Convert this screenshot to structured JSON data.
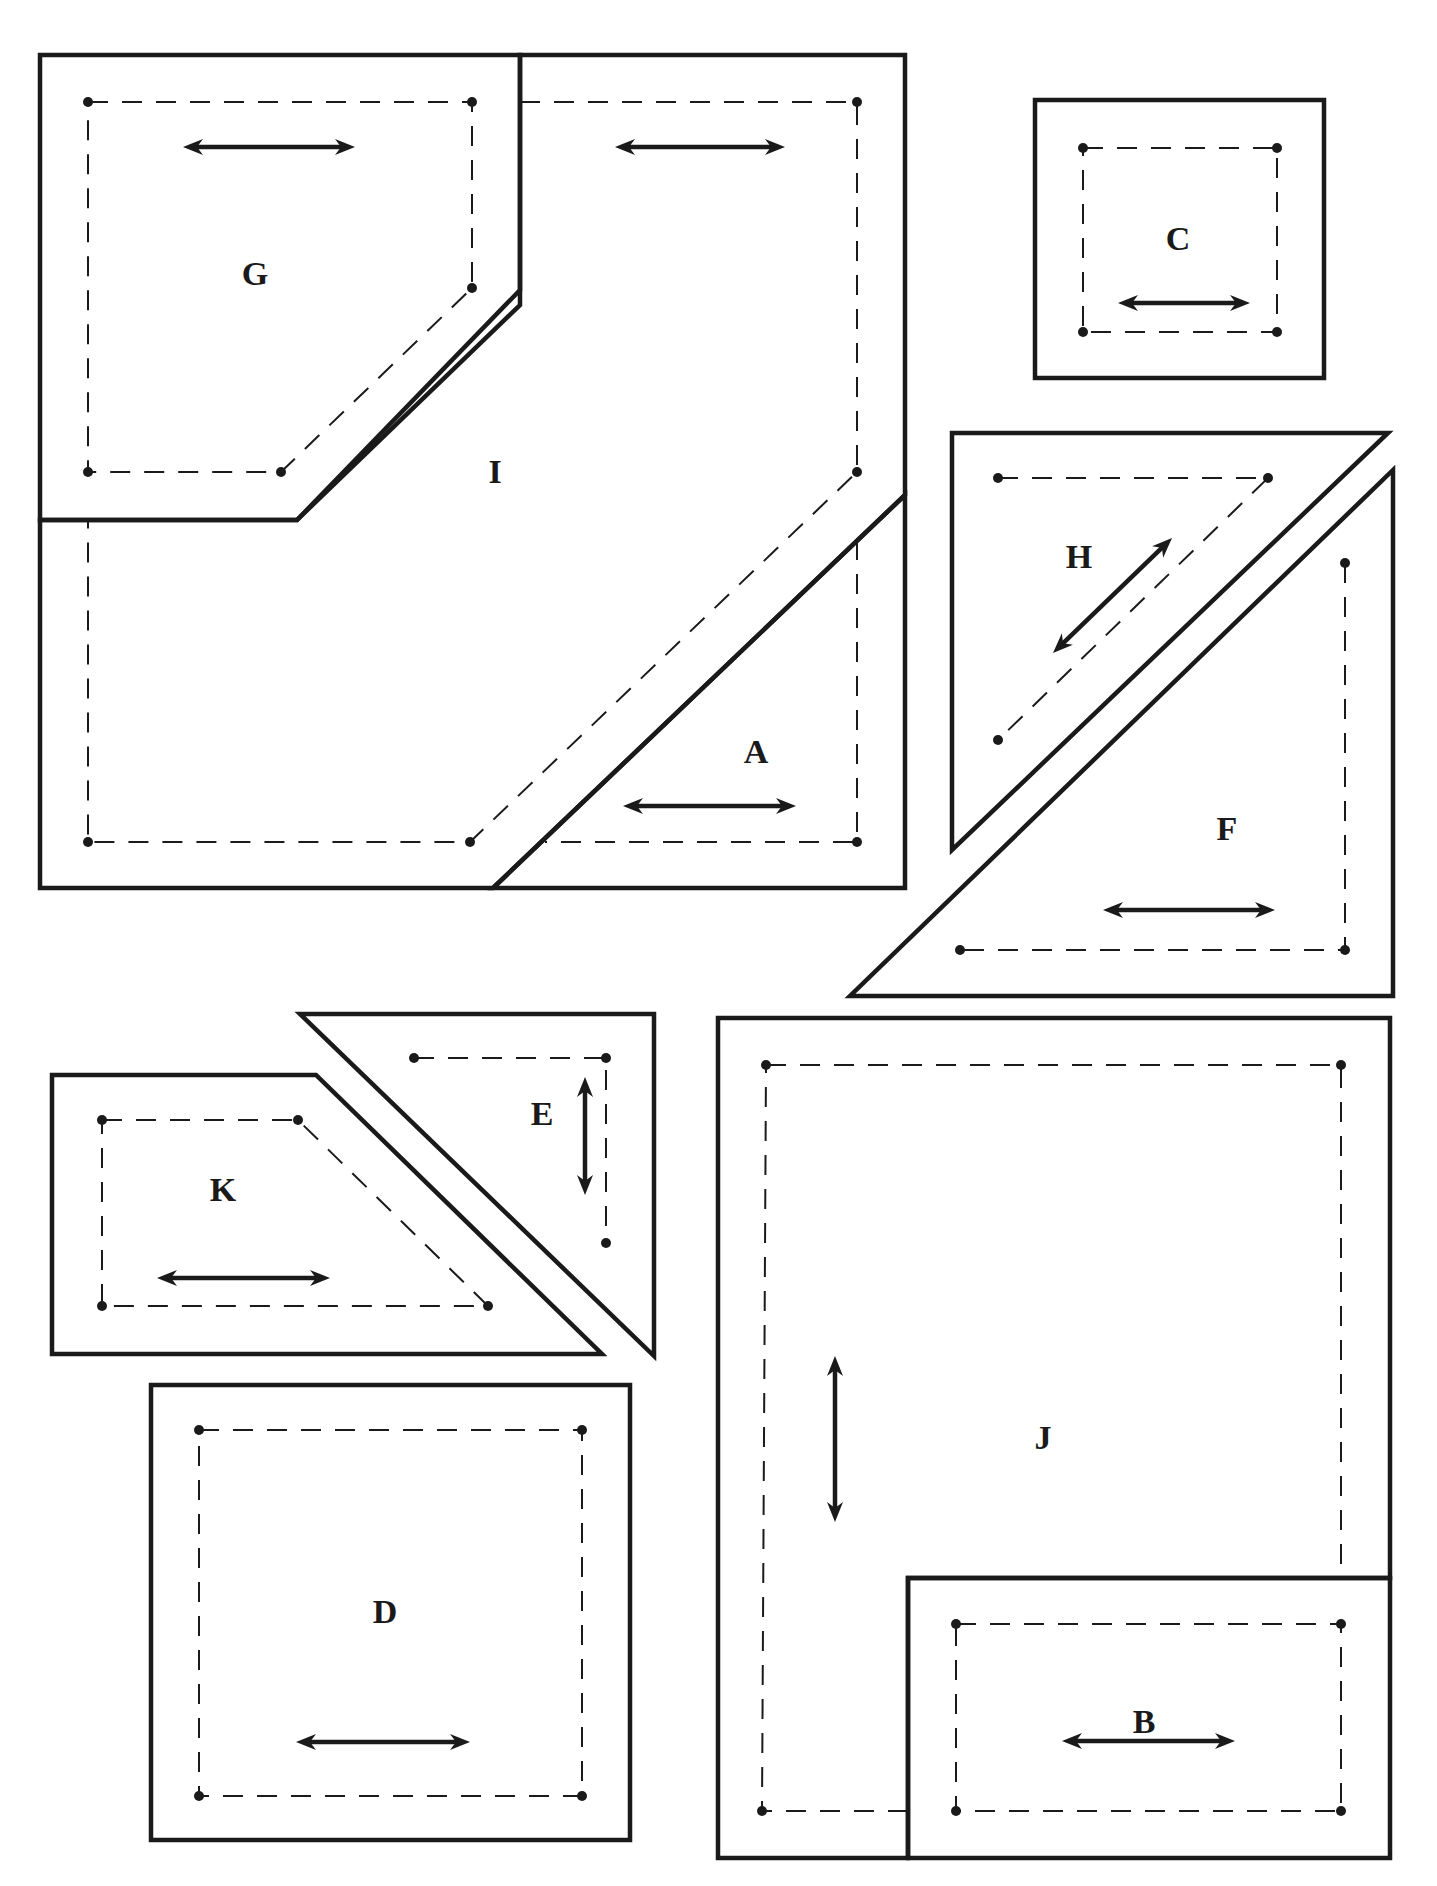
{
  "diagram": {
    "type": "quilt-pattern-templates",
    "colors": {
      "line": "#1a1a1a",
      "background": "#ffffff"
    },
    "pieces": [
      {
        "id": "I",
        "label": "I",
        "label_pos": [
          495,
          475
        ],
        "cut": [
          [
            40,
            55
          ],
          [
            520,
            55
          ],
          [
            520,
            290
          ],
          [
            297,
            520
          ],
          [
            40,
            520
          ],
          [
            40,
            888
          ],
          [
            493,
            888
          ],
          [
            905,
            495
          ],
          [
            905,
            55
          ],
          [
            520,
            55
          ]
        ],
        "cut_outline": [
          [
            520,
            55
          ],
          [
            905,
            55
          ],
          [
            905,
            495
          ],
          [
            493,
            888
          ],
          [
            40,
            888
          ],
          [
            40,
            520
          ],
          [
            297,
            520
          ],
          [
            520,
            290
          ]
        ],
        "sew": [
          [
            520,
            102
          ],
          [
            857,
            102
          ],
          [
            857,
            472
          ],
          [
            470,
            842
          ],
          [
            88,
            842
          ],
          [
            88,
            520
          ]
        ],
        "dots": [
          [
            857,
            102
          ],
          [
            857,
            472
          ],
          [
            470,
            842
          ],
          [
            88,
            842
          ]
        ],
        "grain": {
          "x1": 615,
          "y1": 147,
          "x2": 785,
          "y2": 147
        }
      },
      {
        "id": "G",
        "label": "G",
        "label_pos": [
          255,
          277
        ],
        "cut_outline": [
          [
            40,
            55
          ],
          [
            520,
            55
          ],
          [
            520,
            305
          ],
          [
            297,
            520
          ],
          [
            40,
            520
          ]
        ],
        "sew": [
          [
            88,
            102
          ],
          [
            472,
            102
          ],
          [
            472,
            288
          ],
          [
            281,
            472
          ],
          [
            88,
            472
          ]
        ],
        "dots": [
          [
            88,
            102
          ],
          [
            472,
            102
          ],
          [
            472,
            288
          ],
          [
            281,
            472
          ],
          [
            88,
            472
          ]
        ],
        "grain": {
          "x1": 183,
          "y1": 147,
          "x2": 355,
          "y2": 147
        }
      },
      {
        "id": "A",
        "label": "A",
        "label_pos": [
          756,
          755
        ],
        "cut_outline": [
          [
            905,
            495
          ],
          [
            905,
            888
          ],
          [
            493,
            888
          ]
        ],
        "sew": [
          [
            857,
            540
          ],
          [
            857,
            842
          ],
          [
            545,
            842
          ]
        ],
        "dots": [
          [
            857,
            842
          ]
        ],
        "grain": {
          "x1": 623,
          "y1": 806,
          "x2": 796,
          "y2": 806
        }
      },
      {
        "id": "C",
        "label": "C",
        "label_pos": [
          1178,
          242
        ],
        "cut_outline": [
          [
            1035,
            100
          ],
          [
            1324,
            100
          ],
          [
            1324,
            378
          ],
          [
            1035,
            378
          ]
        ],
        "sew": [
          [
            1083,
            148
          ],
          [
            1277,
            148
          ],
          [
            1277,
            332
          ],
          [
            1083,
            332
          ]
        ],
        "dots": [
          [
            1083,
            148
          ],
          [
            1277,
            148
          ],
          [
            1083,
            332
          ],
          [
            1277,
            332
          ]
        ],
        "grain": {
          "x1": 1118,
          "y1": 303,
          "x2": 1250,
          "y2": 303
        }
      },
      {
        "id": "H",
        "label": "H",
        "label_pos": [
          1079,
          560
        ],
        "cut_outline": [
          [
            952,
            433
          ],
          [
            1388,
            433
          ],
          [
            952,
            850
          ]
        ],
        "sew": [
          [
            998,
            478
          ],
          [
            1268,
            478
          ],
          [
            998,
            740
          ]
        ],
        "dots": [
          [
            998,
            478
          ],
          [
            1268,
            478
          ],
          [
            998,
            740
          ]
        ],
        "grain": {
          "x1": 1172,
          "y1": 538,
          "x2": 1053,
          "y2": 653
        }
      },
      {
        "id": "F",
        "label": "F",
        "label_pos": [
          1227,
          832
        ],
        "cut_outline": [
          [
            1393,
            470
          ],
          [
            1393,
            996
          ],
          [
            850,
            996
          ]
        ],
        "sew": [
          [
            1345,
            563
          ],
          [
            1345,
            950
          ],
          [
            960,
            950
          ]
        ],
        "dots": [
          [
            1345,
            563
          ],
          [
            1345,
            950
          ],
          [
            960,
            950
          ]
        ],
        "grain": {
          "x1": 1103,
          "y1": 910,
          "x2": 1275,
          "y2": 910
        }
      },
      {
        "id": "E",
        "label": "E",
        "label_pos": [
          542,
          1117
        ],
        "cut_outline": [
          [
            300,
            1014
          ],
          [
            654,
            1014
          ],
          [
            654,
            1356
          ]
        ],
        "sew": [
          [
            414,
            1058
          ],
          [
            606,
            1058
          ],
          [
            606,
            1243
          ]
        ],
        "dots": [
          [
            414,
            1058
          ],
          [
            606,
            1058
          ],
          [
            606,
            1243
          ]
        ],
        "grain": {
          "x1": 585,
          "y1": 1077,
          "x2": 585,
          "y2": 1195
        }
      },
      {
        "id": "K",
        "label": "K",
        "label_pos": [
          223,
          1193
        ],
        "cut_outline": [
          [
            52,
            1075
          ],
          [
            316,
            1075
          ],
          [
            602,
            1354
          ],
          [
            52,
            1354
          ]
        ],
        "sew": [
          [
            102,
            1120
          ],
          [
            298,
            1120
          ],
          [
            488,
            1306
          ],
          [
            102,
            1306
          ]
        ],
        "dots": [
          [
            102,
            1120
          ],
          [
            298,
            1120
          ],
          [
            488,
            1306
          ],
          [
            102,
            1306
          ]
        ],
        "grain": {
          "x1": 157,
          "y1": 1278,
          "x2": 330,
          "y2": 1278
        }
      },
      {
        "id": "D",
        "label": "D",
        "label_pos": [
          385,
          1615
        ],
        "cut_outline": [
          [
            151,
            1385
          ],
          [
            630,
            1385
          ],
          [
            630,
            1840
          ],
          [
            151,
            1840
          ]
        ],
        "sew": [
          [
            199,
            1430
          ],
          [
            582,
            1430
          ],
          [
            582,
            1796
          ],
          [
            199,
            1796
          ]
        ],
        "dots": [
          [
            199,
            1430
          ],
          [
            582,
            1430
          ],
          [
            199,
            1796
          ],
          [
            582,
            1796
          ]
        ],
        "grain": {
          "x1": 296,
          "y1": 1742,
          "x2": 470,
          "y2": 1742
        }
      },
      {
        "id": "J",
        "label": "J",
        "label_pos": [
          1043,
          1441
        ],
        "cut_outline": [
          [
            718,
            1018
          ],
          [
            1390,
            1018
          ],
          [
            1390,
            1578
          ],
          [
            908,
            1578
          ],
          [
            908,
            1858
          ],
          [
            718,
            1858
          ]
        ],
        "sew": [
          [
            766,
            1065
          ],
          [
            1341,
            1065
          ],
          [
            1341,
            1578
          ]
        ],
        "sew2": [
          [
            908,
            1811
          ],
          [
            762,
            1811
          ],
          [
            766,
            1065
          ]
        ],
        "dots": [
          [
            766,
            1065
          ],
          [
            1341,
            1065
          ],
          [
            762,
            1811
          ]
        ],
        "grain": {
          "x1": 835,
          "y1": 1356,
          "x2": 835,
          "y2": 1522
        }
      },
      {
        "id": "B",
        "label": "B",
        "label_pos": [
          1144,
          1725
        ],
        "cut_outline": [
          [
            908,
            1578
          ],
          [
            1390,
            1578
          ],
          [
            1390,
            1858
          ],
          [
            908,
            1858
          ]
        ],
        "sew": [
          [
            956,
            1624
          ],
          [
            1341,
            1624
          ],
          [
            1341,
            1811
          ],
          [
            956,
            1811
          ]
        ],
        "dots": [
          [
            956,
            1624
          ],
          [
            1341,
            1624
          ],
          [
            956,
            1811
          ],
          [
            1341,
            1811
          ]
        ],
        "grain": {
          "x1": 1062,
          "y1": 1741,
          "x2": 1235,
          "y2": 1741
        }
      }
    ]
  }
}
